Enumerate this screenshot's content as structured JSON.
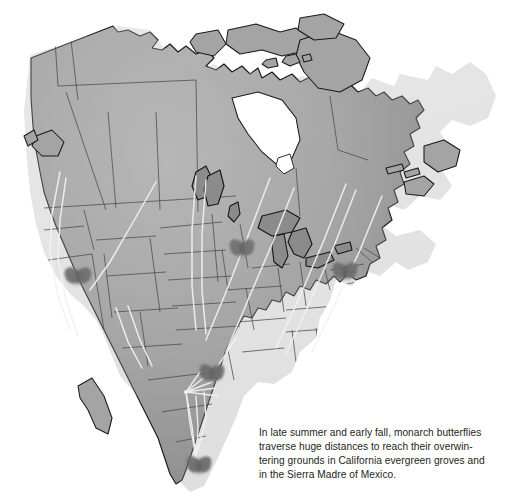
{
  "figure": {
    "kind": "map",
    "background_color": "#ffffff"
  },
  "map": {
    "region_label": "North America",
    "land_fill": "#a9a9a9",
    "land_fill_light": "#b8b8b8",
    "land_fill_shadow": "#8d8d8d",
    "outline_color": "#1a1a1a",
    "internal_border_color": "#4a4a4a",
    "lake_fill": "#8b8b8b",
    "lake_outline": "#151515",
    "route_color": "#f2f2f2",
    "water_color": "#ffffff",
    "lakes": [
      "Great Bear Lake",
      "Great Slave Lake",
      "Lake Winnipeg",
      "Lake Superior",
      "Lake Michigan",
      "Lake Huron",
      "Lake Erie",
      "Lake Ontario"
    ]
  },
  "butterflies": [
    {
      "name": "butterfly-california-nevada",
      "x": 78,
      "y": 277,
      "size": 22,
      "note": "California / Great Basin overwintering area"
    },
    {
      "name": "butterfly-upper-midwest",
      "x": 242,
      "y": 249,
      "size": 21,
      "note": "Upper Midwest breeding range"
    },
    {
      "name": "butterfly-northeast",
      "x": 345,
      "y": 272,
      "size": 21,
      "note": "Northeast breeding range"
    },
    {
      "name": "butterfly-texas",
      "x": 212,
      "y": 374,
      "size": 21,
      "note": "Texas migration corridor"
    },
    {
      "name": "butterfly-sierra-madre",
      "x": 199,
      "y": 466,
      "size": 21,
      "note": "Sierra Madre of Mexico overwintering grounds"
    }
  ],
  "routes": {
    "description": "Pale migration flight lines sweeping south and southwest toward Mexico, plus a fan converging on the Sierra Madre",
    "convergence_point": {
      "x": 186,
      "y": 392
    },
    "terminus": {
      "x": 196,
      "y": 458
    }
  },
  "caption": {
    "lines": [
      "In late summer and early fall, monarch butterflies",
      "traverse huge distances to reach their overwin-",
      "tering grounds in California evergreen groves and",
      "in the Sierra Madre of Mexico."
    ],
    "text": "In late summer and early fall, monarch butterflies traverse huge distances to reach their overwintering grounds in California evergreen groves and in the Sierra Madre of Mexico.",
    "color": "#231f20"
  }
}
